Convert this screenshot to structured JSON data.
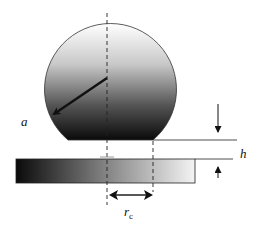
{
  "diagram": {
    "labels": {
      "radius": "a",
      "gap": "h",
      "contact_radius_main": "r",
      "contact_radius_sub": "c"
    },
    "colors": {
      "stroke": "#1a1a1a",
      "gradient_dark": "#0a0a0a",
      "gradient_light": "#ffffff"
    }
  }
}
